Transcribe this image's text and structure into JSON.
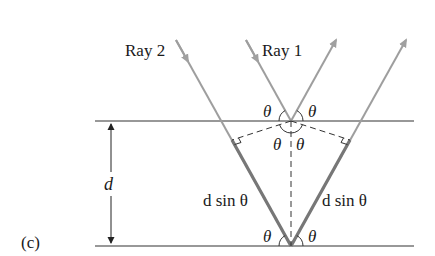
{
  "figure": {
    "panel_label": "(c)",
    "rays": [
      {
        "label": "Ray 2"
      },
      {
        "label": "Ray 1"
      }
    ],
    "spacing_label": "d",
    "path_difference_label_left": "d sin θ",
    "path_difference_label_right": "d sin θ",
    "angle_symbol": "θ",
    "colors": {
      "ray": "#9e9e9e",
      "plane": "#333333",
      "highlight": "#7a7a7a",
      "text": "#1a1a1a"
    }
  }
}
